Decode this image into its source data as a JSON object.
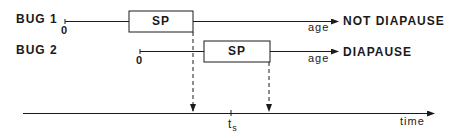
{
  "diagram": {
    "bugs": [
      {
        "label": "BUG 1",
        "origin_label": "0",
        "box_label": "SP",
        "axis_label": "age",
        "outcome": "NOT DIAPAUSE"
      },
      {
        "label": "BUG 2",
        "origin_label": "0",
        "box_label": "SP",
        "axis_label": "age",
        "outcome": "DIAPAUSE"
      }
    ],
    "time_axis": {
      "label": "time",
      "tick_label_main": "t",
      "tick_label_sub": "s"
    },
    "colors": {
      "ink": "#1a1a1a",
      "background": "#ffffff"
    }
  }
}
